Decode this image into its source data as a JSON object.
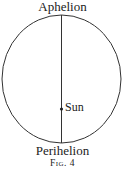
{
  "diagram": {
    "top_label": "Aphelion",
    "bottom_label": "Perihelion",
    "focus_label": "Sun",
    "caption": "Fig. 4"
  }
}
